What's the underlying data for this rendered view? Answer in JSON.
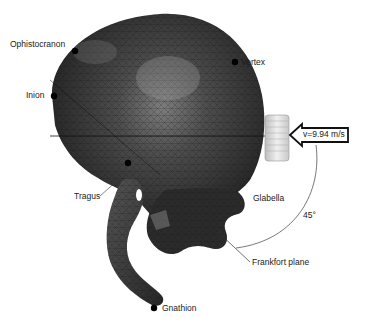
{
  "figure": {
    "colors": {
      "mesh_dark": "#2a2a2a",
      "mesh_mid": "#4a4a4a",
      "mesh_highlight": "#8a8a8a",
      "impactor": "#d9d9d9",
      "line": "#333333",
      "landmark": "#000000"
    }
  },
  "landmarks": [
    {
      "id": "ophistocranon",
      "label": "Ophistocranon"
    },
    {
      "id": "vertex",
      "label": "Vertex"
    },
    {
      "id": "inion",
      "label": "Inion"
    },
    {
      "id": "tragus",
      "label": "Tragus"
    },
    {
      "id": "glabella",
      "label": "Glabella"
    },
    {
      "id": "gnathion",
      "label": "Gnathion"
    }
  ],
  "annotations": {
    "velocity": "v=9.94 m/s",
    "angle": "45°",
    "plane": "Frankfort plane"
  }
}
